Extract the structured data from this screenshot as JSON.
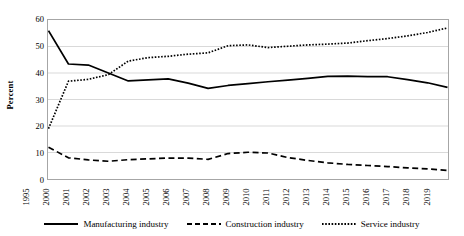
{
  "chart_data": {
    "type": "line",
    "title": "",
    "xlabel": "",
    "ylabel": "Percent",
    "ylim": [
      0,
      60
    ],
    "ytick_step": 10,
    "yticks": [
      0,
      10,
      20,
      30,
      40,
      50,
      60
    ],
    "grid": "horizontal",
    "legend_position": "bottom",
    "categories": [
      "1995",
      "2000",
      "2001",
      "2002",
      "2003",
      "2004",
      "2005",
      "2006",
      "2007",
      "2008",
      "2009",
      "2010",
      "2011",
      "2012",
      "2013",
      "2014",
      "2015",
      "2016",
      "2017",
      "2018",
      "2019"
    ],
    "series": [
      {
        "name": "Manufacturing industry",
        "style": "solid",
        "color": "#000000",
        "values": [
          56.0,
          43.4,
          43.0,
          40.0,
          37.0,
          37.4,
          37.8,
          36.2,
          34.2,
          35.3,
          36.0,
          36.7,
          37.3,
          38.0,
          38.7,
          38.8,
          38.6,
          38.6,
          37.5,
          36.3,
          34.6
        ]
      },
      {
        "name": "Construction industry",
        "style": "dashed",
        "color": "#000000",
        "values": [
          12.0,
          8.0,
          7.2,
          6.7,
          7.3,
          7.6,
          7.9,
          7.9,
          7.4,
          9.6,
          10.1,
          9.8,
          8.1,
          7.0,
          6.1,
          5.5,
          5.1,
          4.7,
          4.2,
          3.8,
          3.2
        ]
      },
      {
        "name": "Service industry",
        "style": "dotted",
        "color": "#000000",
        "values": [
          19.0,
          36.9,
          37.6,
          39.4,
          44.5,
          45.8,
          46.3,
          47.1,
          47.6,
          50.3,
          50.6,
          49.6,
          50.1,
          50.6,
          50.9,
          51.3,
          52.2,
          53.0,
          54.0,
          55.3,
          57.0
        ]
      }
    ]
  },
  "axes": {
    "y_axis_title": "Percent"
  },
  "legend": {
    "items": [
      {
        "label": "Manufacturing industry",
        "style": "solid"
      },
      {
        "label": "Construction industry",
        "style": "dashed"
      },
      {
        "label": "Service industry",
        "style": "dotted"
      }
    ]
  },
  "colors": {
    "series": "#000000",
    "grid": "#d9d9d9",
    "border": "#a6a6a6",
    "background": "#ffffff"
  }
}
